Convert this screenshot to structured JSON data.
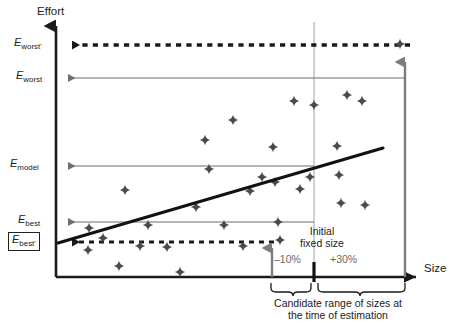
{
  "figure": {
    "axes": {
      "y_label": "Effort",
      "x_label": "Size"
    },
    "y_ticks": [
      {
        "id": "worst_prime",
        "base": "E",
        "sub": "worst'",
        "value_y": 45,
        "boxed": false
      },
      {
        "id": "worst",
        "base": "E",
        "sub": "worst",
        "value_y": 78,
        "boxed": false
      },
      {
        "id": "model",
        "base": "E",
        "sub": "model",
        "value_y": 166,
        "boxed": false
      },
      {
        "id": "best",
        "base": "E",
        "sub": "best",
        "value_y": 222,
        "boxed": false
      },
      {
        "id": "best_prime",
        "base": "E",
        "sub": "best'",
        "value_y": 242,
        "boxed": true
      }
    ],
    "annotations": {
      "initial_fixed_size_line1": "Initial",
      "initial_fixed_size_line2": "fixed size",
      "minus_pct": "–10%",
      "plus_pct": "+30%",
      "caption_line1": "Candidate range of sizes at",
      "caption_line2": "the time of estimation"
    },
    "colors": {
      "ink": "#222222",
      "gray_rule": "#808080",
      "gray_arrow": "#808080",
      "gray_text": "#6a6a6a",
      "background": "#ffffff"
    }
  },
  "chart_data": {
    "type": "scatter",
    "title": "",
    "xlabel": "Size",
    "ylabel": "Effort",
    "grid": false,
    "legend": "none",
    "xlim": [
      56,
      420
    ],
    "ylim": [
      277,
      20
    ],
    "note": "Coordinates below are pixel positions in the 457x327 figure; y grows downward.",
    "points": [
      [
        119,
        266
      ],
      [
        180,
        272
      ],
      [
        88,
        250
      ],
      [
        140,
        246
      ],
      [
        103,
        238
      ],
      [
        167,
        247
      ],
      [
        243,
        246
      ],
      [
        280,
        240
      ],
      [
        89,
        228
      ],
      [
        148,
        225
      ],
      [
        224,
        225
      ],
      [
        278,
        222
      ],
      [
        125,
        190
      ],
      [
        196,
        207
      ],
      [
        250,
        191
      ],
      [
        300,
        189
      ],
      [
        275,
        182
      ],
      [
        209,
        169
      ],
      [
        262,
        177
      ],
      [
        310,
        177
      ],
      [
        339,
        175
      ],
      [
        205,
        140
      ],
      [
        273,
        147
      ],
      [
        337,
        146
      ],
      [
        233,
        120
      ],
      [
        294,
        101
      ],
      [
        314,
        105
      ],
      [
        347,
        95
      ],
      [
        362,
        101
      ],
      [
        341,
        203
      ],
      [
        365,
        205
      ],
      [
        400,
        44
      ]
    ],
    "regression_line": {
      "x1": 58,
      "y1": 243,
      "x2": 383,
      "y2": 148,
      "color": "#1a1a1a",
      "width": 3
    },
    "reference_lines": [
      {
        "id": "E_worst_prime_dotted",
        "y": 45,
        "x_from": 62,
        "x_to": 410,
        "style": "dotted",
        "color": "#1a1a1a",
        "arrow": "left-filled"
      },
      {
        "id": "E_worst_rule",
        "y": 78,
        "x_from": 60,
        "x_to": 405,
        "style": "solid",
        "color": "#808080",
        "arrow": "left-filled"
      },
      {
        "id": "E_model_rule",
        "y": 166,
        "x_from": 60,
        "x_to": 314,
        "style": "solid",
        "color": "#808080",
        "arrow": "left-filled"
      },
      {
        "id": "E_best_rule",
        "y": 222,
        "x_from": 60,
        "x_to": 314,
        "style": "solid",
        "color": "#808080",
        "arrow": "left-filled"
      },
      {
        "id": "E_best_prime_dotted",
        "y": 242,
        "x_from": 62,
        "x_to": 274,
        "style": "dotted",
        "color": "#1a1a1a",
        "arrow": "left-filled"
      }
    ],
    "vertical_markers": [
      {
        "id": "initial-fixed-size-guide",
        "x": 314,
        "y_top": 20,
        "y_bottom": 277,
        "color": "#9a9a9a",
        "style": "thin"
      },
      {
        "id": "lower-bound-arrow",
        "x": 272,
        "y_base": 277,
        "y_tip": 242,
        "color": "#808080",
        "style": "arrow-up"
      },
      {
        "id": "upper-bound-arrow",
        "x": 405,
        "y_base": 277,
        "y_tip": 52,
        "color": "#808080",
        "style": "arrow-up"
      },
      {
        "id": "initial-fixed-size-tick",
        "x": 314,
        "y_from": 262,
        "y_to": 281,
        "color": "#1a1a1a",
        "style": "thick"
      }
    ],
    "braces": [
      {
        "id": "minus-10-brace",
        "x_from": 271,
        "x_to": 311,
        "y": 286,
        "label": "–10%"
      },
      {
        "id": "plus-30-brace",
        "x_from": 317,
        "x_to": 405,
        "y": 286,
        "label": "+30%"
      }
    ]
  }
}
